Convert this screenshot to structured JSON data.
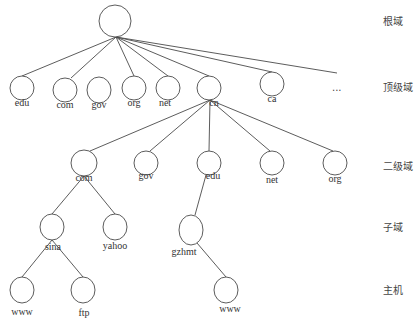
{
  "diagram": {
    "colors": {
      "stroke": "#4a4a4a",
      "text": "#333333",
      "background": "#ffffff"
    },
    "levels": [
      {
        "label": "根域",
        "y": 16
      },
      {
        "label": "顶级域",
        "y": 82
      },
      {
        "label": "二级域",
        "y": 161
      },
      {
        "label": "子域",
        "y": 222
      },
      {
        "label": "主机",
        "y": 285
      }
    ],
    "nodes": [
      {
        "id": "root",
        "label": "",
        "cx": 115,
        "cy": 21,
        "rx": 16,
        "ry": 16
      },
      {
        "id": "edu",
        "label": "edu",
        "cx": 22,
        "cy": 88,
        "rx": 12,
        "ry": 12,
        "lx": 22,
        "ly": 103
      },
      {
        "id": "com",
        "label": "com",
        "cx": 65,
        "cy": 90,
        "rx": 12,
        "ry": 12,
        "lx": 65,
        "ly": 105
      },
      {
        "id": "gov",
        "label": "gov",
        "cx": 99,
        "cy": 90,
        "rx": 12,
        "ry": 13,
        "lx": 99,
        "ly": 105
      },
      {
        "id": "org",
        "label": "org",
        "cx": 134,
        "cy": 88,
        "rx": 12,
        "ry": 12,
        "lx": 134,
        "ly": 103
      },
      {
        "id": "net",
        "label": "net",
        "cx": 168,
        "cy": 88,
        "rx": 12,
        "ry": 12,
        "lx": 165,
        "ly": 103
      },
      {
        "id": "cn",
        "label": "cn",
        "cx": 209,
        "cy": 88,
        "rx": 12,
        "ry": 12,
        "lx": 214,
        "ly": 103
      },
      {
        "id": "ca",
        "label": "ca",
        "cx": 272,
        "cy": 84,
        "rx": 12,
        "ry": 12,
        "lx": 272,
        "ly": 99
      },
      {
        "id": "com2",
        "label": "com",
        "cx": 84,
        "cy": 163,
        "rx": 13,
        "ry": 13,
        "lx": 84,
        "ly": 178
      },
      {
        "id": "gov2",
        "label": "gov",
        "cx": 146,
        "cy": 163,
        "rx": 12,
        "ry": 12,
        "lx": 146,
        "ly": 176
      },
      {
        "id": "edu2",
        "label": "edu",
        "cx": 209,
        "cy": 163,
        "rx": 12,
        "ry": 12,
        "lx": 213,
        "ly": 176
      },
      {
        "id": "net2",
        "label": "net",
        "cx": 272,
        "cy": 163,
        "rx": 12,
        "ry": 12,
        "lx": 272,
        "ly": 180
      },
      {
        "id": "org2",
        "label": "org",
        "cx": 335,
        "cy": 163,
        "rx": 12,
        "ry": 12,
        "lx": 335,
        "ly": 179
      },
      {
        "id": "sina",
        "label": "sina",
        "cx": 52,
        "cy": 227,
        "rx": 12,
        "ry": 13,
        "lx": 53,
        "ly": 247
      },
      {
        "id": "yahoo",
        "label": "yahoo",
        "cx": 115,
        "cy": 227,
        "rx": 12,
        "ry": 13,
        "lx": 115,
        "ly": 246
      },
      {
        "id": "gzhmt",
        "label": "gzhmt",
        "cx": 191,
        "cy": 230,
        "rx": 12,
        "ry": 15,
        "lx": 184,
        "ly": 252
      },
      {
        "id": "www1",
        "label": "www",
        "cx": 22,
        "cy": 290,
        "rx": 12,
        "ry": 13,
        "lx": 22,
        "ly": 312
      },
      {
        "id": "ftp",
        "label": "ftp",
        "cx": 83,
        "cy": 290,
        "rx": 12,
        "ry": 13,
        "lx": 84,
        "ly": 313
      },
      {
        "id": "www2",
        "label": "www",
        "cx": 226,
        "cy": 290,
        "rx": 12,
        "ry": 13,
        "lx": 230,
        "ly": 309
      }
    ],
    "edges": [
      {
        "x1": 116,
        "y1": 37,
        "x2": 22,
        "y2": 76
      },
      {
        "x1": 116,
        "y1": 37,
        "x2": 71,
        "y2": 78
      },
      {
        "x1": 116,
        "y1": 37,
        "x2": 134,
        "y2": 76
      },
      {
        "x1": 116,
        "y1": 37,
        "x2": 168,
        "y2": 76
      },
      {
        "x1": 116,
        "y1": 37,
        "x2": 209,
        "y2": 76
      },
      {
        "x1": 116,
        "y1": 37,
        "x2": 272,
        "y2": 72
      },
      {
        "x1": 116,
        "y1": 37,
        "x2": 337,
        "y2": 73
      },
      {
        "x1": 210,
        "y1": 100,
        "x2": 90,
        "y2": 151
      },
      {
        "x1": 210,
        "y1": 100,
        "x2": 150,
        "y2": 151
      },
      {
        "x1": 210,
        "y1": 100,
        "x2": 209,
        "y2": 151
      },
      {
        "x1": 210,
        "y1": 100,
        "x2": 270,
        "y2": 151
      },
      {
        "x1": 210,
        "y1": 100,
        "x2": 333,
        "y2": 151
      },
      {
        "x1": 84,
        "y1": 176,
        "x2": 52,
        "y2": 214
      },
      {
        "x1": 84,
        "y1": 176,
        "x2": 115,
        "y2": 214
      },
      {
        "x1": 206,
        "y1": 175,
        "x2": 195,
        "y2": 215
      },
      {
        "x1": 52,
        "y1": 240,
        "x2": 22,
        "y2": 277
      },
      {
        "x1": 52,
        "y1": 240,
        "x2": 83,
        "y2": 277
      },
      {
        "x1": 197,
        "y1": 243,
        "x2": 226,
        "y2": 277
      }
    ],
    "ellipsis": {
      "text": "...",
      "x": 332,
      "y": 82
    }
  }
}
